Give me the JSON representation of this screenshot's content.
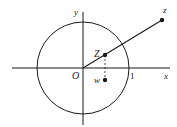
{
  "diagram": {
    "type": "complex-plane",
    "labels": {
      "x_axis": "x",
      "y_axis": "y",
      "origin": "O",
      "unit": "1",
      "point_z": "z",
      "point_Z": "Z",
      "point_w": "w"
    },
    "colors": {
      "stroke": "#1a1a1a",
      "background": "#ffffff"
    }
  }
}
